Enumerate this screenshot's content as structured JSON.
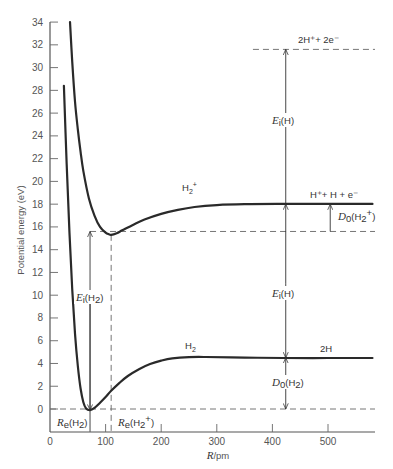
{
  "chart_data": {
    "type": "line",
    "title": "",
    "xlabel": "R/pm",
    "ylabel": "Potential energy (eV)",
    "xlim": [
      0,
      580
    ],
    "ylim": [
      -2,
      34
    ],
    "xticks": [
      0,
      100,
      200,
      300,
      400,
      500
    ],
    "yticks": [
      0,
      2,
      4,
      6,
      8,
      10,
      12,
      14,
      16,
      18,
      20,
      22,
      24,
      26,
      28,
      30,
      32,
      34
    ],
    "grid": false,
    "legend": null,
    "series": [
      {
        "name": "H2",
        "x": [
          25,
          30,
          35,
          40,
          45,
          50,
          55,
          60,
          65,
          72,
          80,
          90,
          100,
          110,
          125,
          140,
          160,
          180,
          200,
          220,
          250,
          280,
          350,
          420,
          500,
          580
        ],
        "y": [
          28.4,
          21.5,
          15.5,
          10.5,
          6.6,
          3.8,
          1.8,
          0.6,
          0.05,
          -0.1,
          0.1,
          0.55,
          1.05,
          1.6,
          2.3,
          2.9,
          3.5,
          3.95,
          4.25,
          4.45,
          4.56,
          4.57,
          4.52,
          4.48,
          4.48,
          4.48
        ]
      },
      {
        "name": "H2+",
        "x": [
          36,
          40,
          45,
          50,
          55,
          60,
          70,
          80,
          90,
          100,
          106,
          110,
          120,
          130,
          150,
          170,
          200,
          230,
          260,
          300,
          350,
          420,
          500,
          580
        ],
        "y": [
          34.0,
          30.5,
          27.0,
          24.6,
          22.6,
          20.9,
          18.5,
          17.0,
          16.0,
          15.5,
          15.35,
          15.3,
          15.45,
          15.7,
          16.2,
          16.65,
          17.15,
          17.5,
          17.75,
          17.92,
          18.0,
          18.02,
          18.02,
          18.02
        ]
      }
    ],
    "reference_lines": [
      {
        "name": "zero-level",
        "y": 0,
        "x_range": [
          0,
          580
        ],
        "style": "dashed"
      },
      {
        "name": "H2+-minimum-level",
        "y": 15.6,
        "x_range": [
          72,
          580
        ],
        "style": "dashed"
      },
      {
        "name": "2H+ + 2e- level",
        "y": 31.6,
        "x_range": [
          365,
          580
        ],
        "style": "dashed"
      },
      {
        "name": "Re(H2)",
        "x": 72,
        "style": "solid-arrow"
      },
      {
        "name": "Re(H2+)",
        "x": 110,
        "y_range": [
          -2,
          15.3
        ],
        "style": "dashed"
      }
    ],
    "annotations": [
      {
        "text": "2H⁺+ 2e⁻",
        "x": 420,
        "y": 32.5
      },
      {
        "text": "E_i(H)",
        "x": 420,
        "y": 25.0,
        "note": "arrow from 18.0 to 31.6"
      },
      {
        "text": "H⁺+ H + e⁻",
        "x": 480,
        "y": 18.5
      },
      {
        "text": "D_0(H₂⁺)",
        "x": 500,
        "y": 16.8,
        "note": "arrow from 15.6 to 18.0"
      },
      {
        "text": "H₂⁺",
        "x": 260,
        "y": 19.0
      },
      {
        "text": "E_i(H₂)",
        "x": 58,
        "y": 10.0,
        "note": "arrow from 0 to 15.6"
      },
      {
        "text": "E_i(H)",
        "x": 420,
        "y": 10.0,
        "note": "arrow from 4.5 to 18.0"
      },
      {
        "text": "H₂",
        "x": 250,
        "y": 5.0
      },
      {
        "text": "2H",
        "x": 500,
        "y": 5.0
      },
      {
        "text": "D_0(H₂)",
        "x": 420,
        "y": 2.5,
        "note": "arrow from 0 to 4.5"
      },
      {
        "text": "R_e(H₂)",
        "x": 30,
        "y": -1.3
      },
      {
        "text": "R_e(H₂⁺)",
        "x": 155,
        "y": -1.3
      }
    ]
  },
  "labels": {
    "ylabel": "Potential energy (eV)",
    "xlabel_italic": "R",
    "xlabel_unit": "/pm",
    "curve_h2": "H",
    "curve_h2_sub": "2",
    "curve_h2p": "H",
    "curve_h2p_sub": "2",
    "curve_h2p_sup": "+",
    "level_top": "2H⁺+ 2e⁻",
    "level_mid": "H⁺+ H + e⁻",
    "level_low": "2H",
    "ei_h_upper": "(H)",
    "ei_h_lower": "(H)",
    "ei_h2": "(H",
    "ei_letter": "E",
    "ei_sub": "i",
    "d0_letter": "D",
    "d0_sub": "0",
    "d0_h2p": "(H",
    "d0_h2": "(H",
    "re_letter": "R",
    "re_sub": "e"
  }
}
